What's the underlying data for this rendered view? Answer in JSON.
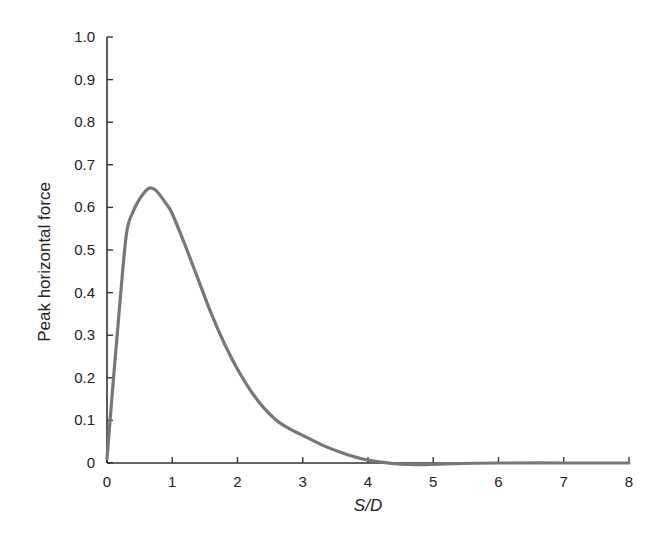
{
  "chart_data": {
    "type": "line",
    "title": "",
    "xlabel": "S/D",
    "ylabel": "Peak horizontal force",
    "xlim": [
      0,
      8
    ],
    "ylim": [
      0,
      1.0
    ],
    "xticks": [
      0,
      1,
      2,
      3,
      4,
      5,
      6,
      7,
      8
    ],
    "xtick_labels": [
      "0",
      "1",
      "2",
      "3",
      "4",
      "5",
      "6",
      "7",
      "8"
    ],
    "yticks": [
      0,
      0.1,
      0.2,
      0.3,
      0.4,
      0.5,
      0.6,
      0.7,
      0.8,
      0.9,
      1.0
    ],
    "ytick_labels": [
      "0",
      "0.1",
      "0.2",
      "0.3",
      "0.4",
      "0.5",
      "0.6",
      "0.7",
      "0.8",
      "0.9",
      "1.0"
    ],
    "grid": false,
    "legend": null,
    "series": [
      {
        "name": "Peak horizontal force",
        "color": "#777777",
        "x": [
          0.0,
          0.1,
          0.2,
          0.3,
          0.4,
          0.5,
          0.6,
          0.66,
          0.75,
          0.9,
          1.0,
          1.2,
          1.4,
          1.6,
          1.8,
          2.0,
          2.2,
          2.4,
          2.6,
          2.8,
          3.0,
          3.3,
          3.6,
          3.9,
          4.2,
          4.5,
          4.8,
          5.2,
          6.0,
          7.0,
          8.0
        ],
        "y": [
          0.01,
          0.2,
          0.38,
          0.54,
          0.59,
          0.62,
          0.64,
          0.646,
          0.64,
          0.61,
          0.585,
          0.51,
          0.43,
          0.35,
          0.28,
          0.22,
          0.17,
          0.13,
          0.1,
          0.08,
          0.065,
          0.042,
          0.024,
          0.01,
          0.002,
          -0.003,
          -0.004,
          -0.002,
          0.0,
          0.0,
          0.0
        ]
      }
    ]
  }
}
